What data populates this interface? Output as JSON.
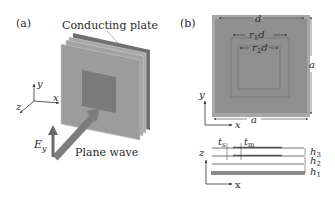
{
  "panel_a": {
    "label": "(a)",
    "plate_label": "Conducting plate",
    "wave_label": "Plane wave",
    "field_label": "E",
    "field_sub": "y",
    "axes": {
      "y": "y",
      "x": "x",
      "z": "z"
    }
  },
  "panel_b": {
    "label": "(b)",
    "top_dim": "d",
    "r1_dim": "r",
    "r1_sub": "1",
    "r1_suffix": "d",
    "r2_dim": "r",
    "r2_sub": "2",
    "r2_suffix": "d",
    "side_dim": "a",
    "bottom_dim": "a",
    "axes": {
      "y": "y",
      "x": "x"
    }
  },
  "panel_b_section": {
    "ts": "t",
    "ts_sub": "s",
    "tm": "t",
    "tm_sub": "m",
    "h3": "h",
    "h3_sub": "3",
    "h2": "h",
    "h2_sub": "2",
    "h1": "h",
    "h1_sub": "1",
    "axes": {
      "z": "z",
      "x": "x"
    }
  },
  "colors": {
    "plate_face": "#9a9a9a",
    "plate_edge": "#b9b9b9",
    "plate_back": "#6f6f6f",
    "center_square": "#7a7a7a",
    "arrow": "#7d7d7d",
    "outer_square": "#a6a6a6",
    "inner_square": "#999999",
    "line": "#444444"
  }
}
